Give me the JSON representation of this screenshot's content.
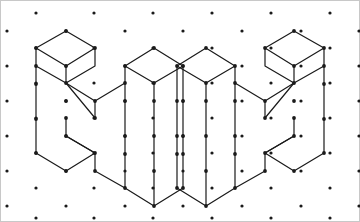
{
  "page": {
    "width": 360,
    "height": 222,
    "background_color": "#ffffff",
    "border_color": "#c8c8c8",
    "border_width": 1
  },
  "grid": {
    "name": "triangular-isometric-dot-lattice",
    "dot_color": "#1a1a1a",
    "dot_radius": 1.6,
    "col_spacing": 59,
    "row_spacing": 35,
    "row_offset_x": 29.5,
    "row_offset_y": 17.5,
    "origin_x": 7,
    "origin_y": 31,
    "columns": 7,
    "rows": 6,
    "points": [
      [
        7,
        31
      ],
      [
        66,
        31
      ],
      [
        125,
        31
      ],
      [
        183,
        31
      ],
      [
        242,
        31
      ],
      [
        301,
        31
      ],
      [
        359,
        31
      ],
      [
        36,
        13
      ],
      [
        94,
        13
      ],
      [
        153,
        13
      ],
      [
        212,
        13
      ],
      [
        271,
        13
      ],
      [
        330,
        13
      ],
      [
        7,
        66
      ],
      [
        66,
        66
      ],
      [
        125,
        66
      ],
      [
        183,
        66
      ],
      [
        242,
        66
      ],
      [
        301,
        66
      ],
      [
        359,
        66
      ],
      [
        36,
        48
      ],
      [
        94,
        48
      ],
      [
        153,
        48
      ],
      [
        212,
        48
      ],
      [
        271,
        48
      ],
      [
        330,
        48
      ],
      [
        7,
        101
      ],
      [
        66,
        101
      ],
      [
        125,
        101
      ],
      [
        183,
        101
      ],
      [
        242,
        101
      ],
      [
        301,
        101
      ],
      [
        359,
        101
      ],
      [
        36,
        83
      ],
      [
        94,
        83
      ],
      [
        153,
        83
      ],
      [
        212,
        83
      ],
      [
        271,
        83
      ],
      [
        330,
        83
      ],
      [
        7,
        136
      ],
      [
        66,
        136
      ],
      [
        125,
        136
      ],
      [
        183,
        136
      ],
      [
        242,
        136
      ],
      [
        301,
        136
      ],
      [
        359,
        136
      ],
      [
        36,
        118
      ],
      [
        94,
        118
      ],
      [
        153,
        118
      ],
      [
        212,
        118
      ],
      [
        271,
        118
      ],
      [
        330,
        118
      ],
      [
        7,
        171
      ],
      [
        66,
        171
      ],
      [
        125,
        171
      ],
      [
        183,
        171
      ],
      [
        242,
        171
      ],
      [
        301,
        171
      ],
      [
        359,
        171
      ],
      [
        36,
        153
      ],
      [
        94,
        153
      ],
      [
        153,
        153
      ],
      [
        212,
        153
      ],
      [
        271,
        153
      ],
      [
        330,
        153
      ],
      [
        7,
        206
      ],
      [
        66,
        206
      ],
      [
        125,
        206
      ],
      [
        183,
        206
      ],
      [
        242,
        206
      ],
      [
        301,
        206
      ],
      [
        359,
        206
      ],
      [
        36,
        188
      ],
      [
        94,
        188
      ],
      [
        153,
        188
      ],
      [
        212,
        188
      ],
      [
        271,
        188
      ],
      [
        330,
        188
      ],
      [
        36,
        218
      ],
      [
        94,
        218
      ],
      [
        153,
        218
      ],
      [
        212,
        218
      ],
      [
        271,
        218
      ],
      [
        330,
        218
      ]
    ]
  },
  "figures": [
    {
      "id": "left-figure",
      "name": "isometric-h-block-left",
      "label": "Left isometric H block",
      "orientation": "left-handed",
      "stroke_color": "#1a1a1a",
      "stroke_width": 1.2,
      "fill": "none",
      "vertex_dot_color": "#1a1a1a",
      "vertex_dot_radius": 1.9,
      "polylines": [
        [
          [
            36,
            48
          ],
          [
            66,
            31
          ],
          [
            95,
            48
          ],
          [
            66,
            66
          ],
          [
            36,
            48
          ]
        ],
        [
          [
            95,
            48
          ],
          [
            95,
            66
          ],
          [
            66,
            83
          ],
          [
            36,
            66
          ],
          [
            36,
            48
          ]
        ],
        [
          [
            66,
            66
          ],
          [
            66,
            83
          ]
        ],
        [
          [
            36,
            66
          ],
          [
            36,
            153
          ]
        ],
        [
          [
            66,
            83
          ],
          [
            95,
            101
          ]
        ],
        [
          [
            95,
            101
          ],
          [
            125,
            83
          ]
        ],
        [
          [
            95,
            101
          ],
          [
            95,
            118
          ]
        ],
        [
          [
            66,
            83
          ],
          [
            95,
            118
          ]
        ],
        [
          [
            125,
            83
          ],
          [
            125,
            66
          ]
        ],
        [
          [
            125,
            66
          ],
          [
            154,
            48
          ]
        ],
        [
          [
            154,
            48
          ],
          [
            183,
            66
          ]
        ],
        [
          [
            183,
            66
          ],
          [
            154,
            83
          ]
        ],
        [
          [
            154,
            83
          ],
          [
            125,
            66
          ]
        ],
        [
          [
            154,
            83
          ],
          [
            154,
            206
          ]
        ],
        [
          [
            183,
            66
          ],
          [
            183,
            188
          ]
        ],
        [
          [
            125,
            83
          ],
          [
            125,
            101
          ]
        ],
        [
          [
            125,
            101
          ],
          [
            125,
            188
          ]
        ],
        [
          [
            36,
            153
          ],
          [
            66,
            171
          ]
        ],
        [
          [
            66,
            171
          ],
          [
            95,
            153
          ]
        ],
        [
          [
            95,
            153
          ],
          [
            66,
            136
          ]
        ],
        [
          [
            66,
            136
          ],
          [
            95,
            153
          ]
        ],
        [
          [
            66,
            136
          ],
          [
            66,
            118
          ]
        ],
        [
          [
            95,
            153
          ],
          [
            95,
            171
          ]
        ],
        [
          [
            95,
            171
          ],
          [
            125,
            188
          ]
        ],
        [
          [
            125,
            188
          ],
          [
            154,
            206
          ]
        ],
        [
          [
            154,
            206
          ],
          [
            183,
            188
          ]
        ]
      ],
      "vertex_dots": [
        [
          66,
          31
        ],
        [
          36,
          48
        ],
        [
          95,
          48
        ],
        [
          66,
          66
        ],
        [
          36,
          66
        ],
        [
          66,
          83
        ],
        [
          95,
          101
        ],
        [
          125,
          83
        ],
        [
          125,
          66
        ],
        [
          154,
          48
        ],
        [
          183,
          66
        ],
        [
          154,
          83
        ],
        [
          36,
          84
        ],
        [
          36,
          119
        ],
        [
          36,
          153
        ],
        [
          66,
          118
        ],
        [
          66,
          136
        ],
        [
          95,
          153
        ],
        [
          95,
          171
        ],
        [
          95,
          118
        ],
        [
          125,
          101
        ],
        [
          125,
          136
        ],
        [
          125,
          154
        ],
        [
          125,
          188
        ],
        [
          154,
          101
        ],
        [
          154,
          136
        ],
        [
          154,
          171
        ],
        [
          154,
          206
        ],
        [
          183,
          101
        ],
        [
          183,
          136
        ],
        [
          183,
          154
        ],
        [
          183,
          188
        ],
        [
          66,
          171
        ],
        [
          66,
          101
        ]
      ]
    },
    {
      "id": "right-figure",
      "name": "isometric-h-block-right",
      "label": "Right isometric H block (mirror image)",
      "orientation": "right-handed",
      "stroke_color": "#1a1a1a",
      "stroke_width": 1.2,
      "fill": "none",
      "vertex_dot_color": "#1a1a1a",
      "vertex_dot_radius": 1.9,
      "mirror_of": "left-figure",
      "mirror_axis_x": 360
    }
  ],
  "relationship": {
    "name": "mirror-pair",
    "description": "Two isometric block letters that are reflections of each other"
  }
}
